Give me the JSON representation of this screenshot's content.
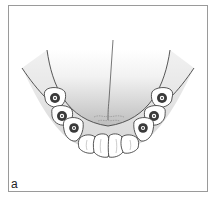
{
  "figure": {
    "panel_label": "a",
    "colors": {
      "frame": "#9a9a9a",
      "line": "#444444",
      "palate_shade": "#c8c8c8",
      "implant_dark": "#3a3a3a",
      "tooth_fill": "#ffffff"
    },
    "implants": {
      "left": [
        "implant-1",
        "implant-2",
        "implant-3"
      ],
      "right": [
        "implant-4",
        "implant-5",
        "implant-6"
      ]
    },
    "anterior_teeth_count": 4
  }
}
